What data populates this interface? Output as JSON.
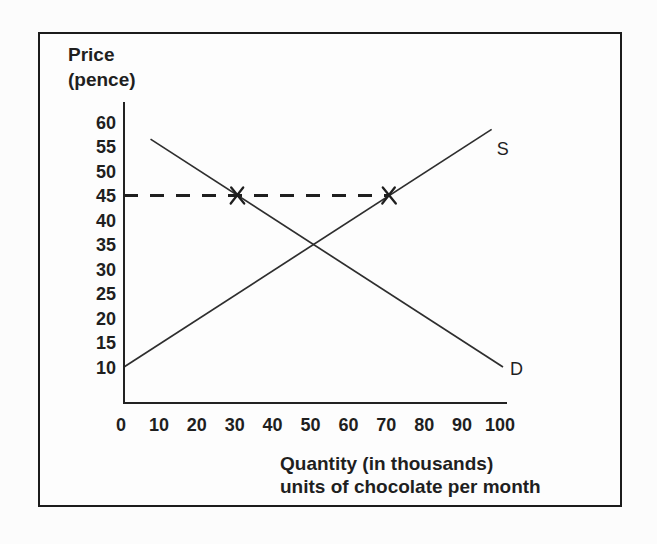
{
  "colors": {
    "ink": "#1f1f1f",
    "line": "#2e2e2e",
    "frame_border": "#1c1c1c",
    "background": "#fcfcfc"
  },
  "chart_data": {
    "type": "line",
    "title": "",
    "xlabel": "Quantity (in thousands) units of chocolate per month",
    "ylabel": "Price (pence)",
    "ylabel_lines": [
      "Price",
      "(pence)"
    ],
    "xlabel_lines": [
      "Quantity (in thousands)",
      "units of chocolate per month"
    ],
    "x_ticks": [
      0,
      10,
      20,
      30,
      40,
      50,
      60,
      70,
      80,
      90,
      100
    ],
    "y_ticks": [
      60,
      55,
      50,
      45,
      40,
      35,
      30,
      25,
      20,
      15,
      10
    ],
    "xlim": [
      0,
      101
    ],
    "ylim": [
      3,
      64
    ],
    "grid": false,
    "legend_position": "inline-end-of-line",
    "series": [
      {
        "name": "supply",
        "label": "S",
        "points": [
          [
            0,
            10
          ],
          [
            97,
            58.5
          ]
        ]
      },
      {
        "name": "demand",
        "label": "D",
        "points": [
          [
            7,
            56.5
          ],
          [
            100,
            10
          ]
        ]
      }
    ],
    "annotations": {
      "dashed_price_line": {
        "type": "horizontal-dashed",
        "price": 45,
        "from_quantity": 0,
        "to_quantity": 70
      },
      "x_marks": [
        {
          "quantity": 30,
          "price": 45
        },
        {
          "quantity": 70,
          "price": 45
        }
      ]
    }
  }
}
